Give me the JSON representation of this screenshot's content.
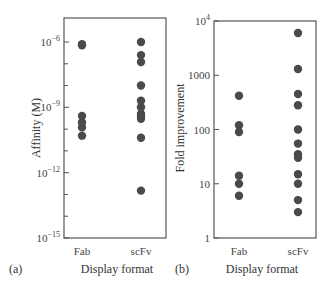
{
  "chart_data": [
    {
      "type": "scatter",
      "panel_label": "(a)",
      "title": "",
      "xlabel": "Display format",
      "ylabel": "Affinity (M)",
      "yscale": "log",
      "ylim": [
        1e-15,
        1e-05
      ],
      "y_ticks": [
        {
          "value": 1e-06,
          "base": "10",
          "exp": "−6"
        },
        {
          "value": 1e-09,
          "base": "10",
          "exp": "−9"
        },
        {
          "value": 1e-12,
          "base": "10",
          "exp": "−12"
        },
        {
          "value": 1e-15,
          "base": "10",
          "exp": "−15"
        }
      ],
      "y_minor_ticks": [
        1e-07,
        1e-08,
        1e-10,
        1e-11,
        1e-13,
        1e-14
      ],
      "categories": [
        "Fab",
        "scFv"
      ],
      "series": [
        {
          "name": "Fab",
          "values": [
            8e-07,
            7e-07,
            4e-10,
            2e-10,
            1.2e-10,
            5e-11
          ]
        },
        {
          "name": "scFv",
          "values": [
            1e-06,
            2.5e-07,
            1.2e-07,
            1e-08,
            2e-09,
            1e-09,
            5e-10,
            4e-10,
            3e-10,
            4e-11,
            1.5e-13
          ]
        }
      ],
      "grid": false
    },
    {
      "type": "scatter",
      "panel_label": "(b)",
      "title": "",
      "xlabel": "Display format",
      "ylabel": "Fold improvement",
      "yscale": "log",
      "ylim": [
        1,
        10000
      ],
      "y_ticks": [
        {
          "value": 10000,
          "base": "10",
          "exp": "4"
        },
        {
          "value": 1000,
          "base": "1000",
          "exp": ""
        },
        {
          "value": 100,
          "base": "100",
          "exp": ""
        },
        {
          "value": 10,
          "base": "10",
          "exp": ""
        },
        {
          "value": 1,
          "base": "1",
          "exp": ""
        }
      ],
      "y_minor_ticks": [],
      "categories": [
        "Fab",
        "scFv"
      ],
      "series": [
        {
          "name": "Fab",
          "values": [
            420,
            120,
            90,
            14,
            10,
            6
          ]
        },
        {
          "name": "scFv",
          "values": [
            6000,
            1300,
            450,
            280,
            100,
            55,
            35,
            30,
            15,
            10,
            5,
            3
          ]
        }
      ],
      "grid": false
    }
  ]
}
